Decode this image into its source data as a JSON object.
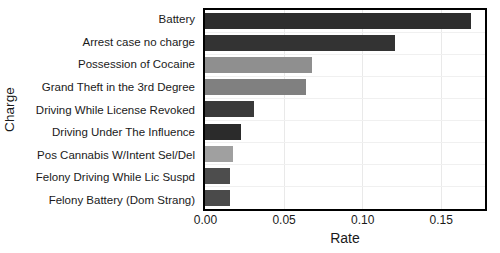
{
  "chart_data": {
    "type": "bar",
    "orientation": "horizontal",
    "title": "",
    "xlabel": "Rate",
    "ylabel": "Charge",
    "categories": [
      "Battery",
      "Arrest case no charge",
      "Possession of Cocaine",
      "Grand Theft in the 3rd Degree",
      "Driving While License Revoked",
      "Driving Under The Influence",
      "Pos Cannabis W/Intent Sel/Del",
      "Felony Driving While Lic Suspd",
      "Felony Battery (Dom Strang)"
    ],
    "values": [
      0.169,
      0.121,
      0.068,
      0.064,
      0.031,
      0.023,
      0.018,
      0.016,
      0.016
    ],
    "bar_colors": [
      "#2e2e2e",
      "#333333",
      "#8f8f8f",
      "#808080",
      "#3a3a3a",
      "#2b2b2b",
      "#a0a0a0",
      "#4d4d4d",
      "#4a4a4a"
    ],
    "xlim": [
      0.0,
      0.1775
    ],
    "xticks": [
      0.0,
      0.05,
      0.1,
      0.15
    ],
    "xtick_labels": [
      "0.00",
      "0.05",
      "0.10",
      "0.15"
    ],
    "grid": true,
    "grid_axis": "both",
    "legend": "none",
    "axis_color": "#000000",
    "background_color": "#ffffff"
  }
}
